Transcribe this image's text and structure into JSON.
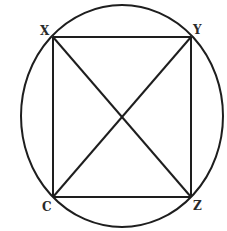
{
  "diagram": {
    "type": "inscribed-quadrilateral",
    "stroke_color": "#1e1e1e",
    "background": "#ffffff",
    "circle": {
      "cx": 122,
      "cy": 116,
      "rx": 101,
      "ry": 111
    },
    "vertices": {
      "X": {
        "label": "X",
        "x": 53,
        "y": 37,
        "label_x": 40,
        "label_y": 35
      },
      "Y": {
        "label": "Y",
        "x": 191,
        "y": 37,
        "label_x": 193,
        "label_y": 34
      },
      "C": {
        "label": "C",
        "x": 53,
        "y": 197,
        "label_x": 42,
        "label_y": 211
      },
      "Z": {
        "label": "Z",
        "x": 191,
        "y": 197,
        "label_x": 193,
        "label_y": 210
      }
    },
    "edges": [
      "XY",
      "YZ",
      "ZC",
      "CX"
    ],
    "diagonals": [
      "XZ",
      "YC"
    ]
  }
}
